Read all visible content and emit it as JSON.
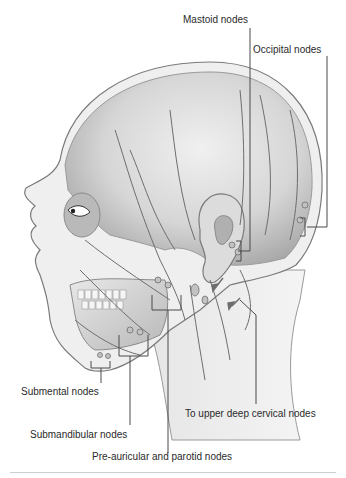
{
  "figure": {
    "labels": {
      "mastoid": "Mastoid nodes",
      "occipital": "Occipital nodes",
      "submental": "Submental nodes",
      "upper_deep_cervical": "To upper deep cervical nodes",
      "submandibular": "Submandibular nodes",
      "preauricular_parotid": "Pre-auricular and parotid nodes"
    },
    "colors": {
      "line": "#4a4a4a",
      "skin_light": "#ececec",
      "skin_mid": "#c9c9c9",
      "skin_dark": "#9a9a9a",
      "vessel": "#6e6e6e",
      "background": "#ffffff"
    }
  }
}
